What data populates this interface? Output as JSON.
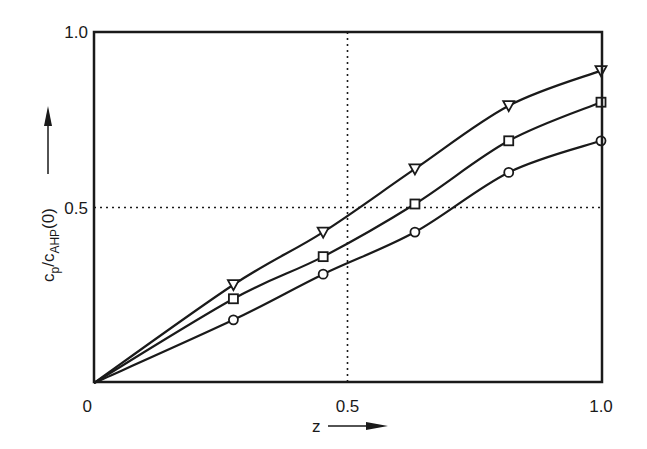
{
  "chart_data": {
    "type": "line",
    "title": "",
    "xlabel": "z",
    "ylabel": {
      "main": "c",
      "sub1": "p",
      "slash": "/c",
      "sub2": "AHP",
      "suffix": "(0)"
    },
    "xlim": [
      0,
      1.0
    ],
    "ylim": [
      0,
      1.0
    ],
    "xticks": [
      {
        "value": 0,
        "label": "0"
      },
      {
        "value": 0.5,
        "label": "0.5"
      },
      {
        "value": 1.0,
        "label": "1.0"
      }
    ],
    "yticks": [
      {
        "value": 0.5,
        "label": "0.5"
      },
      {
        "value": 1.0,
        "label": "1.0"
      }
    ],
    "gridlines": {
      "x": [
        0.5
      ],
      "y": [
        0.5
      ],
      "style": "dotted"
    },
    "grid": true,
    "legend": null,
    "series": [
      {
        "name": "triangle",
        "marker": "triangle-down",
        "x": [
          0.275,
          0.452,
          0.633,
          0.818,
          1.0
        ],
        "y": [
          0.28,
          0.43,
          0.61,
          0.79,
          0.89
        ],
        "curve_origin": [
          0,
          0
        ]
      },
      {
        "name": "square",
        "marker": "square",
        "x": [
          0.275,
          0.452,
          0.633,
          0.818,
          1.0
        ],
        "y": [
          0.24,
          0.36,
          0.51,
          0.69,
          0.8
        ],
        "curve_origin": [
          0,
          0
        ]
      },
      {
        "name": "circle",
        "marker": "circle",
        "x": [
          0.275,
          0.452,
          0.633,
          0.818,
          1.0
        ],
        "y": [
          0.18,
          0.31,
          0.43,
          0.6,
          0.69
        ],
        "curve_origin": [
          0,
          0
        ]
      }
    ],
    "colors": {
      "ink": "#1a1a1a",
      "background": "#ffffff"
    }
  }
}
